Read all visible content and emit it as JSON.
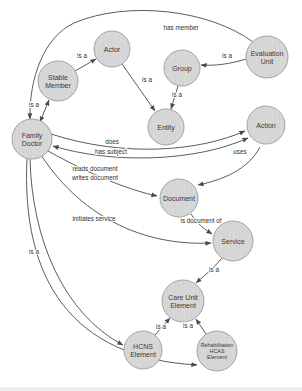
{
  "canvas": {
    "width": 302,
    "height": 391,
    "background": "#ffffff"
  },
  "colors": {
    "node_fill": "#d9d9d9",
    "node_speckle": "#bcbcbc",
    "node_stroke": "#a3a3a3",
    "edge": "#4a4a4a",
    "label": "#2e2e2e"
  },
  "nodes": [
    {
      "id": "family-doctor",
      "label": "Family\nDoctor",
      "x": 32,
      "y": 139,
      "r": 20
    },
    {
      "id": "stable-member",
      "label": "Stable\nMember",
      "x": 58,
      "y": 81,
      "r": 20
    },
    {
      "id": "actor",
      "label": "Actor",
      "x": 112,
      "y": 49,
      "r": 18
    },
    {
      "id": "group",
      "label": "Group",
      "x": 182,
      "y": 68,
      "r": 18
    },
    {
      "id": "evaluation-unit",
      "label": "Evaluation\nUnit",
      "x": 267,
      "y": 57,
      "r": 21
    },
    {
      "id": "entity",
      "label": "Entity",
      "x": 166,
      "y": 127,
      "r": 18
    },
    {
      "id": "action",
      "label": "Action",
      "x": 266,
      "y": 125,
      "r": 19
    },
    {
      "id": "document",
      "label": "Document",
      "x": 179,
      "y": 198,
      "r": 19
    },
    {
      "id": "service",
      "label": "Service",
      "x": 233,
      "y": 241,
      "r": 20
    },
    {
      "id": "care-unit-element",
      "label": "Care Unit\nElement",
      "x": 183,
      "y": 301,
      "r": 21
    },
    {
      "id": "hcns-element",
      "label": "HCNS\nElement",
      "x": 143,
      "y": 350,
      "r": 19
    },
    {
      "id": "rehabilitation-hcas-element",
      "label": "Rehabilitation\nHCAS\nElement",
      "x": 217,
      "y": 351,
      "r": 20,
      "small": true
    }
  ],
  "edges": [
    {
      "id": "is-a-familydoctor-stablemember",
      "label": "is a",
      "path": "M 40,122 L 49,100",
      "lx": 34,
      "ly": 105,
      "double": true
    },
    {
      "id": "is-a-stablemember-actor",
      "label": "is a",
      "path": "M 75,71 L 96,59",
      "lx": 82,
      "ly": 56,
      "double": false
    },
    {
      "id": "is-a-actor-entity",
      "label": "is a",
      "path": "M 122,64 L 155,111",
      "lx": 147,
      "ly": 80,
      "double": false
    },
    {
      "id": "is-a-group-entity",
      "label": "is a",
      "path": "M 178,86 L 171,109",
      "lx": 177,
      "ly": 95,
      "double": false
    },
    {
      "id": "is-a-evaluationunit-group",
      "label": "is a",
      "path": "M 246,59 C 230,64 215,66 201,65",
      "lx": 227,
      "ly": 56,
      "double": false
    },
    {
      "id": "has-member",
      "label": "has member",
      "path": "M 253,42 C 210,10 128,0 74,23 C 44,37 29,78 30,119",
      "lx": 181,
      "ly": 28,
      "double": false
    },
    {
      "id": "does",
      "label": "does",
      "path": "M 51,134 C 125,158 200,151 245,131",
      "lx": 112,
      "ly": 142,
      "double": false
    },
    {
      "id": "has-subject",
      "label": "has subject",
      "path": "M 248,138 C 195,162 112,164 53,146",
      "lx": 111,
      "ly": 152,
      "double": true
    },
    {
      "id": "uses",
      "label": "uses",
      "path": "M 260,147 C 248,170 222,180 198,185",
      "lx": 240,
      "ly": 152,
      "double": false
    },
    {
      "id": "reads-writes-document",
      "label": "reads document\nwrites document",
      "path": "M 48,151 C 95,177 130,190 157,196",
      "lx": 95,
      "ly": 169,
      "double": false
    },
    {
      "id": "is-document-of",
      "label": "is document of",
      "path": "M 191,214 C 198,225 206,230 212,234",
      "lx": 201,
      "ly": 221,
      "double": false
    },
    {
      "id": "initiates-service",
      "label": "initiates service",
      "path": "M 41,155 C 85,222 150,246 211,243",
      "lx": 94,
      "ly": 219,
      "double": false
    },
    {
      "id": "is-a-service-careunit",
      "label": "is a",
      "path": "M 222,258 C 214,268 204,276 196,283",
      "lx": 214,
      "ly": 270,
      "double": false
    },
    {
      "id": "is-a-hcns-careunit",
      "label": "is a",
      "path": "M 155,335 L 170,318",
      "lx": 161,
      "ly": 327,
      "double": false
    },
    {
      "id": "is-a-rehab-careunit",
      "label": "is a",
      "path": "M 206,334 L 196,319",
      "lx": 188,
      "ly": 326,
      "double": false
    },
    {
      "id": "is-a-familydoctor-hcns",
      "label": "is a",
      "path": "M 30,159 C 32,240 64,314 123,345",
      "lx": 34,
      "ly": 252,
      "double": false
    },
    {
      "id": "is-a-familydoctor-rehab",
      "label": "",
      "path": "M 27,158 C 21,280 72,358 197,365",
      "lx": 0,
      "ly": 0,
      "double": false
    }
  ]
}
